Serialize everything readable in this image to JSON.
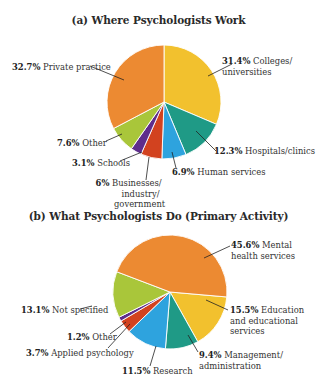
{
  "chart_data": [
    {
      "type": "pie",
      "title": "(a) Where Psychologists Work",
      "center": [
        164,
        102
      ],
      "radius": 57,
      "start_angle_deg": 0,
      "slices": [
        {
          "label": "Colleges/ universities",
          "value": 31.4,
          "color": "#f2c12e"
        },
        {
          "label": "Hospitals/clinics",
          "value": 12.3,
          "color": "#1f9a86"
        },
        {
          "label": "Human services",
          "value": 6.9,
          "color": "#2ea3de"
        },
        {
          "label": "Businesses/ industry/ government",
          "value": 6,
          "color": "#d2421f"
        },
        {
          "label": "Schools",
          "value": 3.1,
          "color": "#5e2d8c"
        },
        {
          "label": "Other",
          "value": 7.6,
          "color": "#a9c63a"
        },
        {
          "label": "Private practice",
          "value": 32.7,
          "color": "#ec8a32"
        }
      ]
    },
    {
      "type": "pie",
      "title": "(b) What Psychologists Do (Primary Activity)",
      "center": [
        170,
        292
      ],
      "radius": 57,
      "start_angle_deg": 95,
      "slices": [
        {
          "label": "Education and educational services",
          "value": 15.5,
          "color": "#f2c12e"
        },
        {
          "label": "Management/ administration",
          "value": 9.4,
          "color": "#1f9a86"
        },
        {
          "label": "Research",
          "value": 11.5,
          "color": "#2ea3de"
        },
        {
          "label": "Applied psychology",
          "value": 3.7,
          "color": "#d2421f"
        },
        {
          "label": "Other",
          "value": 1.2,
          "color": "#5e2d8c"
        },
        {
          "label": "Not specified",
          "value": 13.1,
          "color": "#a9c63a"
        },
        {
          "label": "Mental health services",
          "value": 45.6,
          "color": "#ec8a32"
        }
      ]
    }
  ],
  "labels_a": [
    {
      "pct": "31.4%",
      "text": [
        "Colleges/",
        "universities"
      ]
    },
    {
      "pct": "12.3%",
      "text": [
        "Hospitals/clinics"
      ]
    },
    {
      "pct": "6.9%",
      "text": [
        "Human services"
      ]
    },
    {
      "pct": "6%",
      "text": [
        "Businesses/",
        "industry/",
        "government"
      ]
    },
    {
      "pct": "3.1%",
      "text": [
        "Schools"
      ]
    },
    {
      "pct": "7.6%",
      "text": [
        "Other"
      ]
    },
    {
      "pct": "32.7%",
      "text": [
        "Private practice"
      ]
    }
  ],
  "labels_b": [
    {
      "pct": "45.6%",
      "text": [
        "Mental",
        "health services"
      ]
    },
    {
      "pct": "15.5%",
      "text": [
        "Education",
        "and educational",
        "services"
      ]
    },
    {
      "pct": "9.4%",
      "text": [
        "Management/",
        "administration"
      ]
    },
    {
      "pct": "11.5%",
      "text": [
        "Research"
      ]
    },
    {
      "pct": "3.7%",
      "text": [
        "Applied psychology"
      ]
    },
    {
      "pct": "1.2%",
      "text": [
        "Other"
      ]
    },
    {
      "pct": "13.1%",
      "text": [
        "Not specified"
      ]
    }
  ]
}
